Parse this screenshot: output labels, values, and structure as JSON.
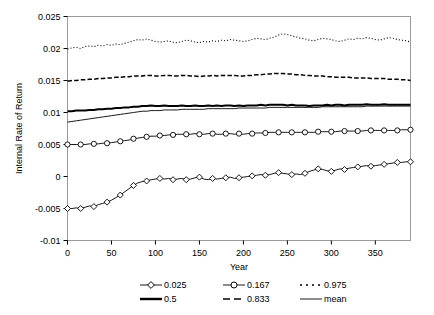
{
  "chart_data": {
    "type": "line",
    "title": "",
    "xlabel": "Year",
    "ylabel": "Internal Rate of Return",
    "xlim": [
      0,
      390
    ],
    "ylim": [
      -0.01,
      0.025
    ],
    "xticks": [
      0,
      50,
      100,
      150,
      200,
      250,
      300,
      350
    ],
    "yticks": [
      -0.01,
      -0.005,
      0,
      0.005,
      0.01,
      0.015,
      0.02,
      0.025
    ],
    "xticklabels": [
      "0",
      "50",
      "100",
      "150",
      "200",
      "250",
      "300",
      "350"
    ],
    "yticklabels": [
      "-0.01",
      "-0.005",
      "0",
      "0.005",
      "0.01",
      "0.015",
      "0.02",
      "0.025"
    ],
    "grid": false,
    "legend_position": "below",
    "legend_entries": [
      {
        "label": "0.025",
        "style": "line-marker",
        "marker": "diamond",
        "color": "#000000"
      },
      {
        "label": "0.167",
        "style": "line-marker",
        "marker": "circle",
        "color": "#000000"
      },
      {
        "label": "0.975",
        "style": "dotted",
        "marker": "none",
        "color": "#000000"
      },
      {
        "label": "0.5",
        "style": "thick-solid",
        "marker": "none",
        "color": "#000000"
      },
      {
        "label": "0.833",
        "style": "dashed",
        "marker": "none",
        "color": "#000000"
      },
      {
        "label": "mean",
        "style": "thin-solid",
        "marker": "none",
        "color": "#000000"
      }
    ],
    "x": [
      0,
      5,
      10,
      15,
      20,
      25,
      30,
      35,
      40,
      45,
      50,
      55,
      60,
      65,
      70,
      75,
      80,
      85,
      90,
      95,
      100,
      105,
      110,
      115,
      120,
      125,
      130,
      135,
      140,
      145,
      150,
      155,
      160,
      165,
      170,
      175,
      180,
      185,
      190,
      195,
      200,
      205,
      210,
      215,
      220,
      225,
      230,
      235,
      240,
      245,
      250,
      255,
      260,
      265,
      270,
      275,
      280,
      285,
      290,
      295,
      300,
      305,
      310,
      315,
      320,
      325,
      330,
      335,
      340,
      345,
      350,
      355,
      360,
      365,
      370,
      375,
      380,
      385,
      390
    ],
    "series": [
      {
        "name": "0.975",
        "values": [
          0.0199,
          0.0201,
          0.0202,
          0.02,
          0.0203,
          0.0204,
          0.0203,
          0.0205,
          0.0204,
          0.0206,
          0.0205,
          0.0207,
          0.0206,
          0.0208,
          0.021,
          0.0212,
          0.0214,
          0.0213,
          0.0215,
          0.0213,
          0.0211,
          0.021,
          0.0211,
          0.0212,
          0.021,
          0.0209,
          0.0211,
          0.0213,
          0.0212,
          0.021,
          0.0209,
          0.0211,
          0.021,
          0.0212,
          0.0211,
          0.0213,
          0.0212,
          0.0214,
          0.0213,
          0.0212,
          0.0211,
          0.0212,
          0.0214,
          0.0216,
          0.0215,
          0.0214,
          0.0216,
          0.0218,
          0.0221,
          0.0223,
          0.0222,
          0.022,
          0.0218,
          0.0216,
          0.0215,
          0.0213,
          0.0212,
          0.0214,
          0.0216,
          0.0215,
          0.0214,
          0.0212,
          0.0211,
          0.0213,
          0.0215,
          0.0214,
          0.0216,
          0.0215,
          0.0217,
          0.0216,
          0.0214,
          0.0213,
          0.0215,
          0.0217,
          0.0216,
          0.0214,
          0.0213,
          0.0212,
          0.021
        ]
      },
      {
        "name": "0.833",
        "values": [
          0.0149,
          0.015,
          0.015,
          0.0151,
          0.0151,
          0.0152,
          0.0152,
          0.0153,
          0.0153,
          0.0154,
          0.0154,
          0.0155,
          0.0155,
          0.0156,
          0.0156,
          0.0157,
          0.0157,
          0.0157,
          0.0158,
          0.0158,
          0.0157,
          0.0157,
          0.0158,
          0.0158,
          0.0157,
          0.0157,
          0.0158,
          0.0158,
          0.0157,
          0.0157,
          0.0156,
          0.0157,
          0.0157,
          0.0158,
          0.0157,
          0.0158,
          0.0158,
          0.0158,
          0.0158,
          0.0157,
          0.0157,
          0.0158,
          0.0158,
          0.0159,
          0.0159,
          0.016,
          0.016,
          0.0161,
          0.0161,
          0.0161,
          0.016,
          0.016,
          0.0159,
          0.0159,
          0.0158,
          0.0158,
          0.0157,
          0.0157,
          0.0157,
          0.0156,
          0.0156,
          0.0155,
          0.0155,
          0.0155,
          0.0155,
          0.0154,
          0.0154,
          0.0154,
          0.0154,
          0.0153,
          0.0153,
          0.0153,
          0.0153,
          0.0152,
          0.0152,
          0.0152,
          0.0151,
          0.0151,
          0.015
        ]
      },
      {
        "name": "0.5",
        "values": [
          0.0102,
          0.0102,
          0.0103,
          0.0103,
          0.0103,
          0.0104,
          0.0104,
          0.0105,
          0.0105,
          0.0106,
          0.0106,
          0.0107,
          0.0107,
          0.0108,
          0.0108,
          0.0109,
          0.0109,
          0.011,
          0.011,
          0.0111,
          0.011,
          0.011,
          0.0111,
          0.011,
          0.011,
          0.011,
          0.0111,
          0.011,
          0.011,
          0.0111,
          0.011,
          0.011,
          0.0111,
          0.011,
          0.0111,
          0.011,
          0.0111,
          0.0111,
          0.011,
          0.0111,
          0.011,
          0.0111,
          0.0111,
          0.0111,
          0.0112,
          0.0111,
          0.0112,
          0.0112,
          0.0112,
          0.0112,
          0.0111,
          0.0112,
          0.0111,
          0.0111,
          0.0111,
          0.011,
          0.0111,
          0.0111,
          0.0111,
          0.0112,
          0.0111,
          0.0112,
          0.0112,
          0.0111,
          0.0112,
          0.0112,
          0.0112,
          0.0112,
          0.0113,
          0.0112,
          0.0112,
          0.0112,
          0.0113,
          0.0112,
          0.0112,
          0.0112,
          0.0112,
          0.0112,
          0.0112
        ]
      },
      {
        "name": "mean",
        "values": [
          0.0085,
          0.0086,
          0.0087,
          0.0088,
          0.0089,
          0.009,
          0.0091,
          0.0092,
          0.0093,
          0.0094,
          0.0095,
          0.0096,
          0.0097,
          0.0098,
          0.0099,
          0.01,
          0.0101,
          0.0102,
          0.0102,
          0.0103,
          0.0103,
          0.0103,
          0.0104,
          0.0104,
          0.0104,
          0.0104,
          0.0105,
          0.0105,
          0.0105,
          0.0105,
          0.0105,
          0.0105,
          0.0106,
          0.0106,
          0.0106,
          0.0106,
          0.0106,
          0.0106,
          0.0106,
          0.0107,
          0.0107,
          0.0107,
          0.0107,
          0.0107,
          0.0107,
          0.0107,
          0.0108,
          0.0108,
          0.0108,
          0.0108,
          0.0108,
          0.0108,
          0.0108,
          0.0108,
          0.0108,
          0.0108,
          0.0108,
          0.0108,
          0.0109,
          0.0109,
          0.0109,
          0.0109,
          0.0109,
          0.0109,
          0.0109,
          0.0109,
          0.0109,
          0.0109,
          0.011,
          0.011,
          0.011,
          0.011,
          0.011,
          0.011,
          0.011,
          0.011,
          0.011,
          0.011,
          0.011
        ]
      },
      {
        "name": "0.167",
        "values": [
          0.005,
          0.005,
          0.005,
          0.005,
          0.005,
          0.0051,
          0.0051,
          0.0051,
          0.0052,
          0.0052,
          0.0053,
          0.0054,
          0.0055,
          0.0056,
          0.0057,
          0.0059,
          0.006,
          0.0061,
          0.0062,
          0.0063,
          0.0063,
          0.0064,
          0.0064,
          0.0065,
          0.0065,
          0.0066,
          0.0066,
          0.0066,
          0.0066,
          0.0067,
          0.0066,
          0.0066,
          0.0067,
          0.0067,
          0.0066,
          0.0066,
          0.0067,
          0.0067,
          0.0066,
          0.0067,
          0.0066,
          0.0067,
          0.0067,
          0.0068,
          0.0068,
          0.0068,
          0.0069,
          0.0069,
          0.0069,
          0.0069,
          0.0069,
          0.0069,
          0.0069,
          0.0069,
          0.0069,
          0.0069,
          0.0069,
          0.007,
          0.007,
          0.007,
          0.007,
          0.007,
          0.0071,
          0.0071,
          0.0071,
          0.0071,
          0.0071,
          0.0071,
          0.0072,
          0.0072,
          0.0072,
          0.0072,
          0.0072,
          0.0072,
          0.0072,
          0.0072,
          0.0073,
          0.0073,
          0.0073
        ]
      },
      {
        "name": "0.025",
        "values": [
          -0.005,
          -0.005,
          -0.0049,
          -0.005,
          -0.0048,
          -0.0046,
          -0.0047,
          -0.0044,
          -0.0042,
          -0.004,
          -0.0037,
          -0.0033,
          -0.0029,
          -0.0024,
          -0.0019,
          -0.0014,
          -0.001,
          -0.0008,
          -0.0007,
          -0.0005,
          -0.0004,
          -0.0003,
          -0.0004,
          -0.0003,
          -0.0005,
          -0.0004,
          -0.0003,
          -0.0005,
          -0.0004,
          -0.0002,
          -0.0001,
          -0.0004,
          -0.0005,
          -0.0003,
          -0.0004,
          -0.0003,
          -0.0002,
          -0.0001,
          -0.0003,
          -0.0002,
          -0.0001,
          0.0,
          0.0001,
          0.0002,
          0.0003,
          0.0002,
          0.0003,
          0.0005,
          0.0006,
          0.0005,
          0.0004,
          0.0003,
          0.0004,
          0.0003,
          0.0005,
          0.0008,
          0.001,
          0.0012,
          0.0011,
          0.0009,
          0.0008,
          0.001,
          0.0012,
          0.0011,
          0.0013,
          0.0014,
          0.0015,
          0.0016,
          0.0017,
          0.0016,
          0.0017,
          0.0018,
          0.0019,
          0.002,
          0.0021,
          0.0022,
          0.0022,
          0.0023,
          0.0023
        ]
      }
    ]
  }
}
